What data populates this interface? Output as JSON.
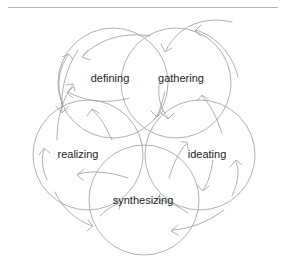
{
  "page": {
    "background_color": "#ffffff",
    "width": 285,
    "height": 277
  },
  "top_rule": {
    "color": "#b6b6b6"
  },
  "diagram": {
    "title": "",
    "type": "cyclic-process-venn",
    "stroke_color": "#9a9a9a",
    "label_color": "#1c1c1c",
    "circle_radius": 55,
    "nodes": [
      {
        "id": "defining",
        "label": "defining",
        "cx": 113,
        "cy": 83,
        "label_x": 110,
        "label_y": 79
      },
      {
        "id": "gathering",
        "label": "gathering",
        "cx": 176,
        "cy": 83,
        "label_x": 181,
        "label_y": 79
      },
      {
        "id": "realizing",
        "label": "realizing",
        "cx": 88,
        "cy": 155,
        "label_x": 78,
        "label_y": 155
      },
      {
        "id": "ideating",
        "label": "ideating",
        "cx": 200,
        "cy": 155,
        "label_x": 207,
        "label_y": 155
      },
      {
        "id": "synthesizing",
        "label": "synthesizing",
        "cx": 144,
        "cy": 200,
        "label_x": 143,
        "label_y": 201
      }
    ]
  }
}
